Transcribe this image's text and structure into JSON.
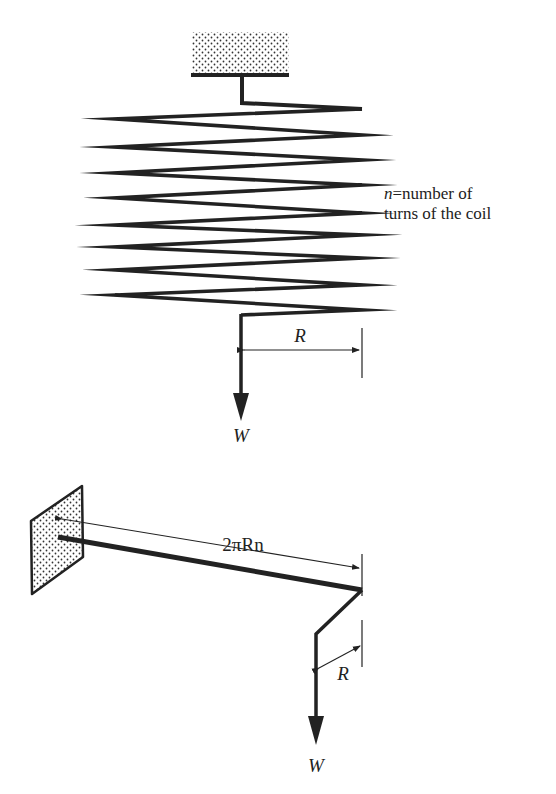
{
  "figure": {
    "top": {
      "title": "Helical coil spring under axial load",
      "radius_label": "R",
      "load_label": "W",
      "note": {
        "variable": "n",
        "equals": "=",
        "line1_rest": "number of",
        "line2": "turns of the coil"
      }
    },
    "bottom": {
      "title": "Equivalent straight wire (unwound) loaded in torsion",
      "length_label": "2πRn",
      "radius_label": "R",
      "load_label": "W"
    },
    "colors": {
      "ink": "#222222",
      "background": "#ffffff",
      "stipple": "#333333"
    }
  }
}
